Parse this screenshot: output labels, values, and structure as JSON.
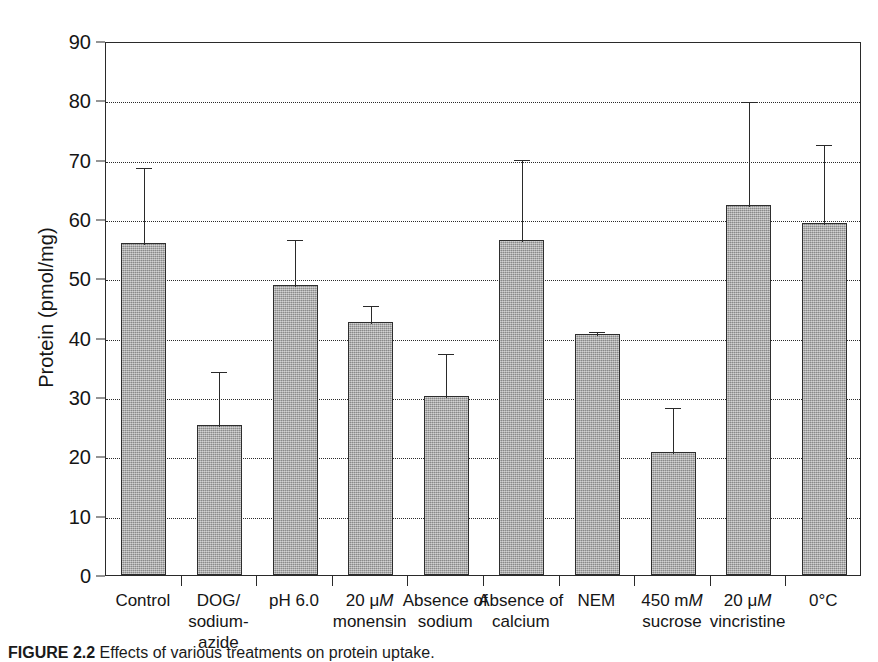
{
  "figure": {
    "caption_label": "FIGURE 2.2",
    "caption_text": "Effects of various treatments on protein uptake."
  },
  "chart_data": {
    "type": "bar",
    "title": "",
    "xlabel": "",
    "ylabel": "Protein (pmol/mg)",
    "ylim": [
      0,
      90
    ],
    "ytick_values": [
      0,
      10,
      20,
      30,
      40,
      50,
      60,
      70,
      80,
      90
    ],
    "ytick_labels": [
      "0",
      "10",
      "20",
      "30",
      "40",
      "50",
      "60",
      "70",
      "80",
      "90"
    ],
    "grid": "horizontal-dotted",
    "legend": "none",
    "bar_color": "#a9a9a9",
    "bar_edge_color": "#2e2e2e",
    "error_bar_type": "upper-only",
    "categories": [
      "Control",
      "DOG/ sodium-azide",
      "pH 6.0",
      "20 μM monensin",
      "Absence of sodium",
      "Absence of calcium",
      "NEM",
      "450 mM sucrose",
      "20 μM vincristine",
      "0°C"
    ],
    "category_lines": [
      [
        "Control"
      ],
      [
        "DOG/ sodium-",
        "azide"
      ],
      [
        "pH 6.0"
      ],
      [
        "20 μM",
        "monensin"
      ],
      [
        "Absence of",
        "sodium"
      ],
      [
        "Absence of",
        "calcium"
      ],
      [
        "NEM"
      ],
      [
        "450 mM",
        "sucrose"
      ],
      [
        "20 μM",
        "vincristine"
      ],
      [
        "0°C"
      ]
    ],
    "values": [
      56.0,
      25.2,
      48.8,
      42.6,
      30.1,
      56.5,
      40.7,
      20.8,
      62.4,
      59.4
    ],
    "error_upper": [
      69.0,
      34.5,
      56.8,
      45.6,
      37.6,
      70.2,
      41.3,
      28.4,
      80.0,
      72.8
    ]
  }
}
